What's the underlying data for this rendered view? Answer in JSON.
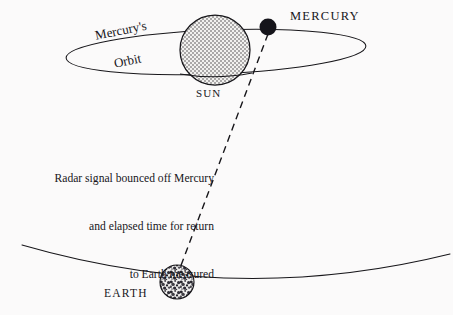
{
  "figure": {
    "background_color": "#fbfafa",
    "ink_color": "#17161a",
    "title": "Radar signal bounced off Mercury"
  },
  "labels": {
    "mercury_planet": "MERCURY",
    "sun": "SUN",
    "earth": "EARTH",
    "mercury_orbit_line1": "Mercury's",
    "mercury_orbit_line2": "Orbit"
  },
  "caption": {
    "line1": "Radar signal bounced off Mercury",
    "line2": "and elapsed time for return",
    "line3": "to Earth measured"
  },
  "bodies": {
    "sun": {
      "name": "SUN",
      "center_x": 215,
      "center_y": 50,
      "radius": 35,
      "fill_style": "fine-dot-stipple",
      "fill_color": "#e9e8e6",
      "outline_color": "#17161a"
    },
    "mercury": {
      "name": "MERCURY",
      "center_x": 268,
      "center_y": 27,
      "radius": 8.5,
      "fill_style": "solid",
      "fill_color": "#15141a"
    },
    "earth": {
      "name": "EARTH",
      "center_x": 177,
      "center_y": 282,
      "radius": 17,
      "fill_style": "coarse-mottled-speckle",
      "fill_color": "#d9d8d6",
      "outline_color": "#17161a"
    }
  },
  "orbits": {
    "mercury_orbit": {
      "name": "Mercury's Orbit",
      "type": "ellipse",
      "center_x": 216,
      "center_y": 52,
      "rx": 150,
      "ry": 22,
      "rotation_deg": -2.5,
      "stroke": "#17161a"
    },
    "earth_orbit": {
      "name": "Earth's Orbit",
      "type": "arc",
      "start_x": 22,
      "start_y": 245,
      "end_x": 450,
      "end_y": 254,
      "sag_y": 288,
      "stroke": "#17161a"
    }
  },
  "radar_signal": {
    "name": "radar-signal-path",
    "style": "dashed",
    "dash_length": 7,
    "gap_length": 5,
    "from_x": 268,
    "from_y": 33,
    "to_x": 180,
    "to_y": 268,
    "stroke": "#17161a"
  }
}
